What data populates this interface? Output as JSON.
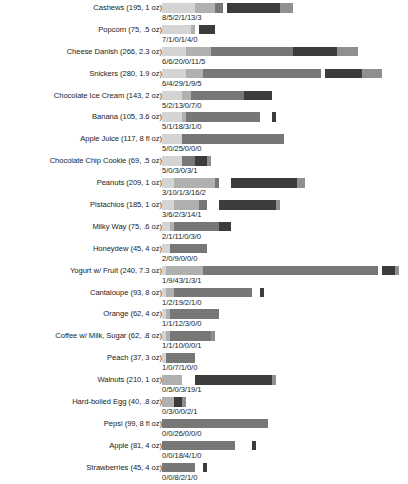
{
  "chart_data": {
    "type": "bar",
    "subtype": "stacked-horizontal-bar",
    "title": "",
    "subtitle": "",
    "xlabel": "",
    "ylabel": "",
    "grid": false,
    "legend_position": "none",
    "axis": {
      "x_visible": false,
      "y_visible": false,
      "x_tick_labels": [],
      "y_tick_labels": []
    },
    "series": [
      {
        "name": "segment-1",
        "color": "#d4d4d4"
      },
      {
        "name": "segment-2",
        "color": "#b0b0b0"
      },
      {
        "name": "segment-3",
        "color": "#777777"
      },
      {
        "name": "segment-4",
        "color": "#ffffff"
      },
      {
        "name": "segment-5",
        "color": "#3c3c3c"
      },
      {
        "name": "segment-6",
        "color": "#8f8f8f"
      }
    ],
    "unit_px": 4.08,
    "categories": [
      "Cashews (195, 1 oz)",
      "Popcorn (75, .5 oz)",
      "Cheese Danish (266, 2.3 oz)",
      "Snickers (280, 1.9 oz)",
      "Chocolate Ice Cream (143, 2 oz)",
      "Banana (105, 3.6 oz)",
      "Apple Juice (117, 8 fl oz)",
      "Chocolate Chip Cookie (69, .5 oz)",
      "Peanuts (209, 1 oz)",
      "Pistachios (185, 1 oz)",
      "Milky Way (75, .6 oz)",
      "Honeydew (45, 4 oz)",
      "Yogurt w/ Fruit (240, 7.3 oz)",
      "Cantaloupe (93, 8 oz)",
      "Orange (62, 4 oz)",
      "Coffee w/ Milk, Sugar (62, .8 oz)",
      "Peach (37, 3 oz)",
      "Walnuts (210, 1 oz)",
      "Hard-boiled Egg (40, .8 oz)",
      "Pepsi (99, 8 fl oz)",
      "Apple (81, 4 oz)",
      "Strawberries (45, 4 oz)"
    ],
    "values": [
      [
        8,
        5,
        2,
        1,
        13,
        3
      ],
      [
        7,
        1,
        0,
        1,
        4,
        0
      ],
      [
        6,
        6,
        20,
        0,
        11,
        5
      ],
      [
        6,
        4,
        29,
        1,
        9,
        5
      ],
      [
        5,
        2,
        13,
        0,
        7,
        0
      ],
      [
        5,
        1,
        18,
        3,
        1,
        0
      ],
      [
        5,
        0,
        25,
        0,
        0,
        0
      ],
      [
        5,
        0,
        3,
        0,
        3,
        1
      ],
      [
        3,
        10,
        1,
        3,
        16,
        2
      ],
      [
        3,
        6,
        2,
        3,
        14,
        1
      ],
      [
        2,
        1,
        11,
        0,
        3,
        0
      ],
      [
        2,
        0,
        9,
        0,
        0,
        0
      ],
      [
        1,
        9,
        43,
        1,
        3,
        1
      ],
      [
        1,
        2,
        19,
        2,
        1,
        0
      ],
      [
        1,
        1,
        12,
        3,
        0,
        0
      ],
      [
        1,
        1,
        10,
        0,
        0,
        1
      ],
      [
        1,
        0,
        7,
        1,
        0,
        0
      ],
      [
        0,
        5,
        0,
        3,
        19,
        1
      ],
      [
        0,
        3,
        0,
        0,
        2,
        1
      ],
      [
        0,
        0,
        26,
        0,
        0,
        0
      ],
      [
        0,
        0,
        18,
        4,
        1,
        0
      ],
      [
        0,
        0,
        8,
        2,
        1,
        0
      ]
    ],
    "value_labels": [
      "8/5/2/1/13/3",
      "7/1/0/1/4/0",
      "6/6/20/0/11/5",
      "6/4/29/1/9/5",
      "5/2/13/0/7/0",
      "5/1/18/3/1/0",
      "5/0/25/0/0/0",
      "5/0/3/0/3/1",
      "3/10/1/3/16/2",
      "3/6/2/3/14/1",
      "2/1/11/0/3/0",
      "2/0/9/0/0/0",
      "1/9/43/1/3/1",
      "1/2/19/2/1/0",
      "1/1/12/3/0/0",
      "1/1/10/0/0/1",
      "1/0/7/1/0/0",
      "0/5/0/3/19/1",
      "0/3/0/0/2/1",
      "0/0/26/0/0/0",
      "0/0/18/4/1/0",
      "0/0/8/2/1/0"
    ]
  }
}
